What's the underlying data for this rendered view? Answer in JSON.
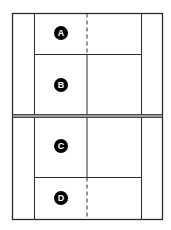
{
  "diagram": {
    "type": "badminton-court",
    "colors": {
      "line": "#2a2a2a",
      "label_bg": "#000000",
      "label_fg": "#ffffff",
      "background": "#ffffff"
    },
    "zones": [
      {
        "id": "A",
        "label": "A"
      },
      {
        "id": "B",
        "label": "B"
      },
      {
        "id": "C",
        "label": "C"
      },
      {
        "id": "D",
        "label": "D"
      }
    ]
  }
}
